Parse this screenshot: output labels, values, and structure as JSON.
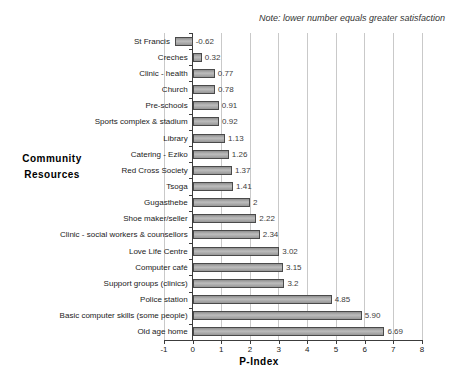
{
  "note": "Note: lower number equals greater satisfaction",
  "chart_data": {
    "type": "bar",
    "orientation": "horizontal",
    "title": "",
    "xlabel": "P-Index",
    "ylabel": "Community Resources",
    "ylabel_lines": [
      "Community",
      "Resources"
    ],
    "xlim": [
      -1,
      8
    ],
    "xticks": [
      -1,
      0,
      1,
      2,
      3,
      4,
      5,
      6,
      7,
      8
    ],
    "grid": "vertical gridlines at integer ticks",
    "legend": "none",
    "categories": [
      "St Francis",
      "Creches",
      "Clinic - health",
      "Church",
      "Pre-schools",
      "Sports complex & stadium",
      "Library",
      "Catering - Eziko",
      "Red Cross Society",
      "Tsoga",
      "Gugasthebe",
      "Shoe maker/seller",
      "Clinic - social workers & counsellors",
      "Love Life Centre",
      "Computer café",
      "Support groups (clinics)",
      "Police station",
      "Basic computer skills (some people)",
      "Old age home"
    ],
    "values": [
      -0.62,
      0.32,
      0.77,
      0.78,
      0.91,
      0.92,
      1.13,
      1.26,
      1.37,
      1.41,
      2,
      2.22,
      2.34,
      3.02,
      3.15,
      3.2,
      4.85,
      5.9,
      6.69
    ],
    "value_labels": [
      "-0.62",
      "0.32",
      "0.77",
      "0.78",
      "0.91",
      "0.92",
      "1.13",
      "1.26",
      "1.37",
      "1.41",
      "2",
      "2.22",
      "2.34",
      "3.02",
      "3.15",
      "3.2",
      "4.85",
      "5.90",
      "6.69"
    ],
    "colors": {
      "bar_fill": "#a3a3a3",
      "bar_border": "#4a4a4a",
      "gridline": "#c9c9c9",
      "axis": "#3c3c3c",
      "text": "#1a1a1a"
    }
  }
}
